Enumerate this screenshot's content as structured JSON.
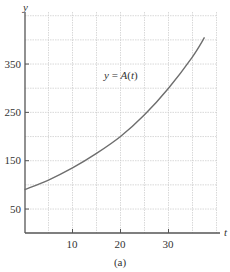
{
  "chart_data": {
    "type": "line",
    "title": "",
    "caption": "(a)",
    "xlabel": "t",
    "ylabel": "y",
    "xlim": [
      0,
      40
    ],
    "ylim": [
      0,
      450
    ],
    "x_ticks": [
      10,
      20,
      30
    ],
    "y_ticks": [
      50,
      150,
      250,
      350
    ],
    "grid": true,
    "grid_x_step": 5,
    "grid_y_step": 50,
    "legend": null,
    "annotations": [
      {
        "text": "y = A(t)",
        "x": 17,
        "y": 320
      }
    ],
    "series": [
      {
        "name": "A(t)",
        "x": [
          0,
          5,
          10,
          15,
          20,
          25,
          30,
          35,
          37.5
        ],
        "y": [
          90,
          110,
          135,
          165,
          200,
          245,
          300,
          365,
          405
        ]
      }
    ]
  },
  "labels": {
    "y_axis": "y",
    "x_axis": "t",
    "curve": "y = A(t)",
    "caption": "(a)",
    "xt0": "10",
    "xt1": "20",
    "xt2": "30",
    "yt0": "50",
    "yt1": "150",
    "yt2": "250",
    "yt3": "350"
  },
  "colors": {
    "curve": "#6e6e6e",
    "axis": "#555555",
    "grid": "#c8c8c8"
  }
}
